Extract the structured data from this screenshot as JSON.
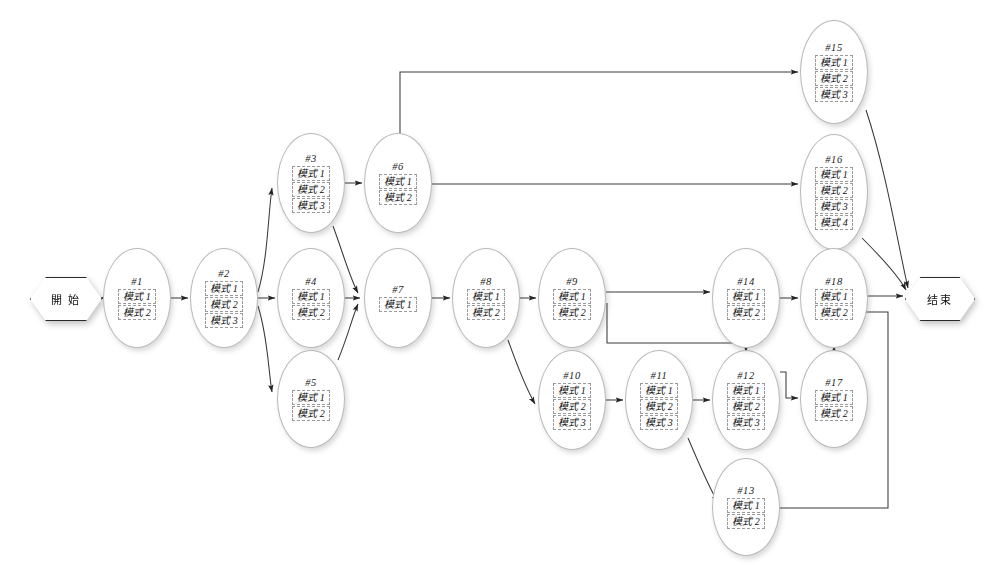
{
  "diagram": {
    "type": "flowchart",
    "background": "#ffffff",
    "line_color": "#3a3a3a",
    "node_border_color": "#b9b9b9",
    "mode_box_border_color": "#9a9a9a",
    "start": {
      "label": "開 始",
      "name": "start-terminator",
      "x": 30,
      "y": 277,
      "w": 72,
      "h": 44
    },
    "end": {
      "label": "结束",
      "name": "end-terminator",
      "x": 905,
      "y": 277,
      "w": 70,
      "h": 44
    },
    "nodes": [
      {
        "id": "#1",
        "x": 103,
        "y": 248,
        "w": 68,
        "h": 100,
        "modes": [
          "模式 1",
          "模式 2"
        ]
      },
      {
        "id": "#2",
        "x": 190,
        "y": 248,
        "w": 68,
        "h": 100,
        "modes": [
          "模式 1",
          "模式 2",
          "模式 3"
        ]
      },
      {
        "id": "#3",
        "x": 277,
        "y": 133,
        "w": 68,
        "h": 100,
        "modes": [
          "模式 1",
          "模式 2",
          "模式 3"
        ]
      },
      {
        "id": "#4",
        "x": 277,
        "y": 248,
        "w": 68,
        "h": 100,
        "modes": [
          "模式 1",
          "模式 2"
        ]
      },
      {
        "id": "#5",
        "x": 277,
        "y": 350,
        "w": 68,
        "h": 98,
        "modes": [
          "模式 1",
          "模式 2"
        ]
      },
      {
        "id": "#6",
        "x": 364,
        "y": 133,
        "w": 68,
        "h": 100,
        "modes": [
          "模式 1",
          "模式 2"
        ]
      },
      {
        "id": "#7",
        "x": 364,
        "y": 248,
        "w": 68,
        "h": 100,
        "modes": [
          "模式 1"
        ]
      },
      {
        "id": "#8",
        "x": 452,
        "y": 248,
        "w": 68,
        "h": 100,
        "modes": [
          "模式 1",
          "模式 2"
        ]
      },
      {
        "id": "#9",
        "x": 538,
        "y": 248,
        "w": 68,
        "h": 100,
        "modes": [
          "模式 1",
          "模式 2"
        ]
      },
      {
        "id": "#10",
        "x": 538,
        "y": 350,
        "w": 68,
        "h": 100,
        "modes": [
          "模式 1",
          "模式 2",
          "模式 3"
        ]
      },
      {
        "id": "#11",
        "x": 625,
        "y": 350,
        "w": 68,
        "h": 100,
        "modes": [
          "模式 1",
          "模式 2",
          "模式 3"
        ]
      },
      {
        "id": "#12",
        "x": 712,
        "y": 350,
        "w": 68,
        "h": 100,
        "modes": [
          "模式 1",
          "模式 2",
          "模式 3"
        ]
      },
      {
        "id": "#13",
        "x": 712,
        "y": 458,
        "w": 68,
        "h": 98,
        "modes": [
          "模式 1",
          "模式 2"
        ]
      },
      {
        "id": "#14",
        "x": 712,
        "y": 248,
        "w": 68,
        "h": 100,
        "modes": [
          "模式 1",
          "模式 2"
        ]
      },
      {
        "id": "#15",
        "x": 800,
        "y": 20,
        "w": 68,
        "h": 104,
        "modes": [
          "模式 1",
          "模式 2",
          "模式 3"
        ]
      },
      {
        "id": "#16",
        "x": 800,
        "y": 134,
        "w": 68,
        "h": 116,
        "modes": [
          "模式 1",
          "模式 2",
          "模式 3",
          "模式 4"
        ]
      },
      {
        "id": "#17",
        "x": 800,
        "y": 350,
        "w": 68,
        "h": 98,
        "modes": [
          "模式 1",
          "模式 2"
        ]
      },
      {
        "id": "#18",
        "x": 800,
        "y": 248,
        "w": 68,
        "h": 100,
        "modes": [
          "模式 1",
          "模式 2"
        ]
      }
    ],
    "edges": [
      {
        "from": "start",
        "to": "#1"
      },
      {
        "from": "#1",
        "to": "#2"
      },
      {
        "from": "#2",
        "to": "#3"
      },
      {
        "from": "#2",
        "to": "#4"
      },
      {
        "from": "#2",
        "to": "#5"
      },
      {
        "from": "#3",
        "to": "#6"
      },
      {
        "from": "#3",
        "to": "#7"
      },
      {
        "from": "#4",
        "to": "#7"
      },
      {
        "from": "#5",
        "to": "#7"
      },
      {
        "from": "#6",
        "to": "#15"
      },
      {
        "from": "#6",
        "to": "#16"
      },
      {
        "from": "#7",
        "to": "#8"
      },
      {
        "from": "#8",
        "to": "#9"
      },
      {
        "from": "#8",
        "to": "#10"
      },
      {
        "from": "#9",
        "to": "#14"
      },
      {
        "from": "#9",
        "to": "#12"
      },
      {
        "from": "#10",
        "to": "#11"
      },
      {
        "from": "#11",
        "to": "#12"
      },
      {
        "from": "#11",
        "to": "#13"
      },
      {
        "from": "#12",
        "to": "#14"
      },
      {
        "from": "#12",
        "to": "#17"
      },
      {
        "from": "#13",
        "to": "#18"
      },
      {
        "from": "#14",
        "to": "#18"
      },
      {
        "from": "#15",
        "to": "end"
      },
      {
        "from": "#16",
        "to": "end"
      },
      {
        "from": "#17",
        "to": "#18"
      },
      {
        "from": "#18",
        "to": "end"
      }
    ]
  }
}
